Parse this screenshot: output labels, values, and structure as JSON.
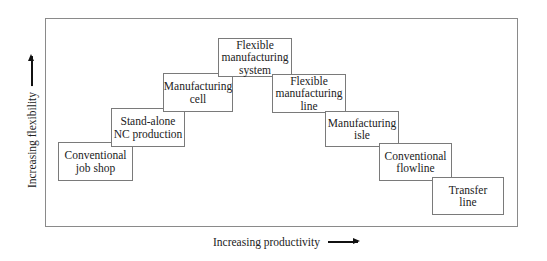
{
  "diagram": {
    "y_axis_label": "Increasing flexibility",
    "x_axis_label": "Increasing productivity",
    "boxes": [
      {
        "id": "conventional-job-shop",
        "label": "Conventional\njob shop",
        "x": 58,
        "y": 142,
        "w": 75,
        "h": 39
      },
      {
        "id": "stand-alone-nc-production",
        "label": "Stand-alone\nNC production",
        "x": 111,
        "y": 108,
        "w": 74,
        "h": 39
      },
      {
        "id": "manufacturing-cell",
        "label": "Manufacturing\ncell",
        "x": 163,
        "y": 73,
        "w": 70,
        "h": 39
      },
      {
        "id": "flexible-manufacturing-system",
        "label": "Flexible\nmanufacturing\nsystem",
        "x": 218,
        "y": 38,
        "w": 74,
        "h": 39
      },
      {
        "id": "flexible-manufacturing-line",
        "label": "Flexible\nmanufacturing\nline",
        "x": 272,
        "y": 74,
        "w": 74,
        "h": 39
      },
      {
        "id": "manufacturing-isle",
        "label": "Manufacturing\nisle",
        "x": 325,
        "y": 111,
        "w": 74,
        "h": 36
      },
      {
        "id": "conventional-flowline",
        "label": "Conventional\nflowline",
        "x": 379,
        "y": 143,
        "w": 73,
        "h": 38
      },
      {
        "id": "transfer-line",
        "label": "Transfer\nline",
        "x": 432,
        "y": 177,
        "w": 72,
        "h": 38
      }
    ]
  }
}
